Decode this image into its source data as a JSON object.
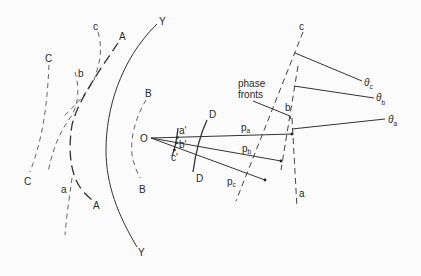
{
  "diagram": {
    "left_curves": {
      "C_top": "C",
      "C_bottom": "C",
      "c_top": "c",
      "b_top": "b",
      "a_mid": "a",
      "A_top": "A",
      "A_bottom": "A",
      "Y_top": "Y",
      "Y_bottom": "Y",
      "B_top": "B",
      "B_bottom": "B"
    },
    "origin": {
      "label": "O"
    },
    "near_points": {
      "a": "a'",
      "b": "b'",
      "c": "c'"
    },
    "arc_D": {
      "top": "D",
      "bottom": "D"
    },
    "rays": [
      {
        "id": "a",
        "label": "p",
        "sub": "a"
      },
      {
        "id": "b",
        "label": "p",
        "sub": "b"
      },
      {
        "id": "c",
        "label": "p",
        "sub": "c"
      }
    ],
    "phase_fronts": {
      "line1": "phase",
      "line2": "fronts",
      "c": "c",
      "b": "b",
      "a": "a"
    },
    "angles": [
      {
        "id": "c",
        "symbol": "θ",
        "sub": "c"
      },
      {
        "id": "b",
        "symbol": "θ",
        "sub": "b"
      },
      {
        "id": "a",
        "symbol": "θ",
        "sub": "a"
      }
    ]
  }
}
